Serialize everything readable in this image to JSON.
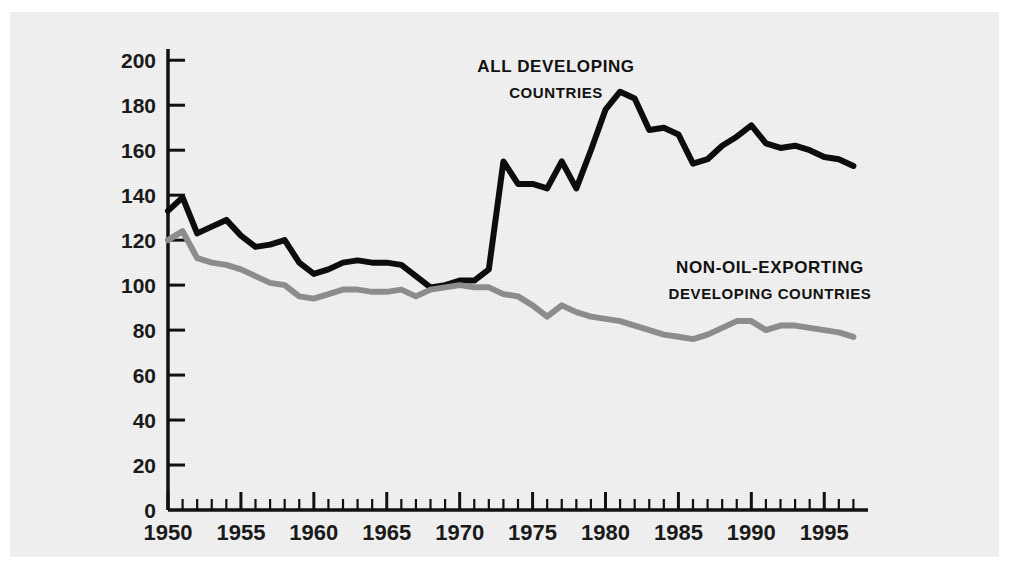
{
  "figure": {
    "background_color": "#ffffff",
    "panel_color": "#e8e8e8"
  },
  "chart_data": {
    "type": "line",
    "title": "",
    "subtitle": "",
    "xlabel": "",
    "ylabel": "",
    "xlim": [
      1950,
      1998
    ],
    "ylim": [
      0,
      205
    ],
    "y_ticks": [
      0,
      20,
      40,
      60,
      80,
      100,
      120,
      140,
      160,
      180,
      200
    ],
    "y_tick_labels": [
      "0",
      "20",
      "40",
      "60",
      "80",
      "100",
      "120",
      "140",
      "160",
      "180",
      "200"
    ],
    "x_ticks_major": [
      1950,
      1955,
      1960,
      1965,
      1970,
      1975,
      1980,
      1985,
      1990,
      1995
    ],
    "x_tick_labels": [
      "1950",
      "1955",
      "1960",
      "1965",
      "1970",
      "1975",
      "1980",
      "1985",
      "1990",
      "1995"
    ],
    "x_minor_tick_interval": 1,
    "grid": false,
    "legend_position": "inline-annotation",
    "series": [
      {
        "name": "All developing countries",
        "label_line_1": "All developing",
        "label_line_2": "countries",
        "color": "#0d0d0d",
        "line_width": 6,
        "x": [
          1950,
          1951,
          1952,
          1953,
          1954,
          1955,
          1956,
          1957,
          1958,
          1959,
          1960,
          1961,
          1962,
          1963,
          1964,
          1965,
          1966,
          1967,
          1968,
          1969,
          1970,
          1971,
          1972,
          1973,
          1974,
          1975,
          1976,
          1977,
          1978,
          1979,
          1980,
          1981,
          1982,
          1983,
          1984,
          1985,
          1986,
          1987,
          1988,
          1989,
          1990,
          1991,
          1992,
          1993,
          1994,
          1995,
          1996,
          1997
        ],
        "values": [
          133,
          139,
          123,
          126,
          129,
          122,
          117,
          118,
          120,
          110,
          105,
          107,
          110,
          111,
          110,
          110,
          109,
          104,
          99,
          100,
          102,
          102,
          107,
          155,
          145,
          145,
          143,
          155,
          143,
          160,
          178,
          186,
          183,
          169,
          170,
          167,
          154,
          156,
          162,
          166,
          171,
          163,
          161,
          162,
          160,
          157,
          156,
          153
        ]
      },
      {
        "name": "Non-oil-exporting developing countries",
        "label_line_1": "Non-oil-exporting",
        "label_line_2": "developing countries",
        "color": "#8c8c8c",
        "line_width": 6,
        "x": [
          1950,
          1951,
          1952,
          1953,
          1954,
          1955,
          1956,
          1957,
          1958,
          1959,
          1960,
          1961,
          1962,
          1963,
          1964,
          1965,
          1966,
          1967,
          1968,
          1969,
          1970,
          1971,
          1972,
          1973,
          1974,
          1975,
          1976,
          1977,
          1978,
          1979,
          1980,
          1981,
          1982,
          1983,
          1984,
          1985,
          1986,
          1987,
          1988,
          1989,
          1990,
          1991,
          1992,
          1993,
          1994,
          1995,
          1996,
          1997
        ],
        "values": [
          120,
          124,
          112,
          110,
          109,
          107,
          104,
          101,
          100,
          95,
          94,
          96,
          98,
          98,
          97,
          97,
          98,
          95,
          98,
          99,
          100,
          99,
          99,
          96,
          95,
          91,
          86,
          91,
          88,
          86,
          85,
          84,
          82,
          80,
          78,
          77,
          76,
          78,
          81,
          84,
          84,
          80,
          82,
          82,
          81,
          80,
          79,
          77
        ]
      }
    ],
    "annotations": [
      {
        "series": "All developing countries",
        "text_line_1": "All developing",
        "text_line_2": "countries",
        "x_px": 556,
        "y_px": 72
      },
      {
        "series": "Non-oil-exporting developing countries",
        "text_line_1": "Non-oil-exporting",
        "text_line_2": "developing countries",
        "x_px": 770,
        "y_px": 273
      }
    ]
  }
}
